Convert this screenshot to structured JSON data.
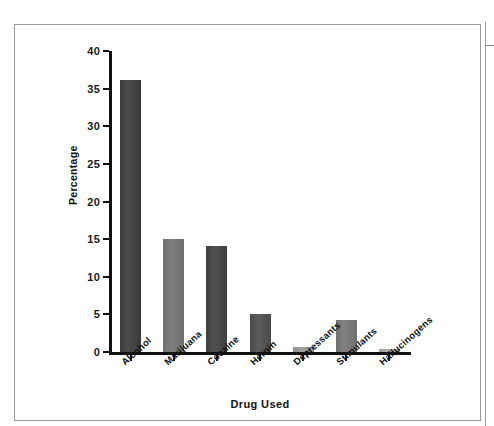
{
  "figure": {
    "frame_border_color": "#9a9a9a",
    "background": "#ffffff"
  },
  "chart_data": {
    "type": "bar",
    "title": "",
    "subtitle": "",
    "xlabel": "Drug Used",
    "ylabel": "Percentage",
    "categories": [
      "Alcohol",
      "Marijuana",
      "Cocaine",
      "Heroin",
      "Depressants",
      "Stimulants",
      "Hallucinogens"
    ],
    "values": [
      36.2,
      15.0,
      14.1,
      5.0,
      0.7,
      4.2,
      0.4
    ],
    "bar_colors": [
      "#3a3a3a",
      "#6e6e6e",
      "#3f3f3f",
      "#4a4a4a",
      "#8e8e8e",
      "#707070",
      "#9a9a9a"
    ],
    "ylim": [
      0,
      40
    ],
    "yticks": [
      0,
      5,
      10,
      15,
      20,
      25,
      30,
      35,
      40
    ],
    "ytick_labels": [
      "0",
      "5",
      "10",
      "15",
      "20",
      "25",
      "30",
      "35",
      "40"
    ],
    "grid": false,
    "legend": null,
    "legend_position": "none",
    "annotations": []
  }
}
